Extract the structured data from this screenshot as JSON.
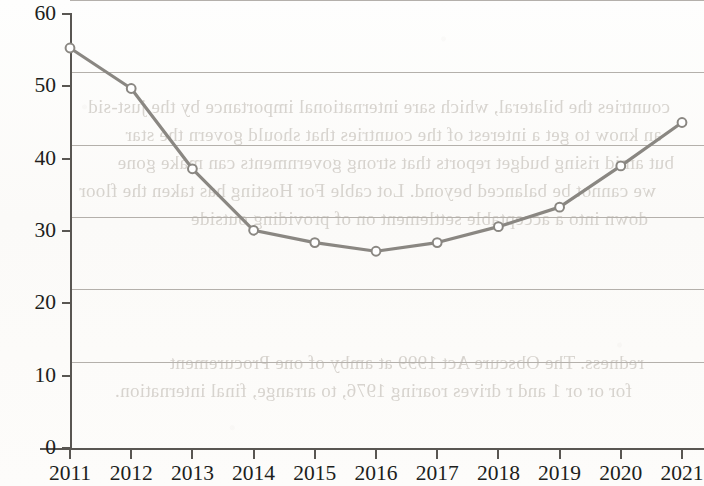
{
  "chart_data": {
    "type": "line",
    "title": "",
    "xlabel": "",
    "ylabel": "",
    "categories": [
      "2011",
      "2012",
      "2013",
      "2014",
      "2015",
      "2016",
      "2017",
      "2018",
      "2019",
      "2020",
      "2021"
    ],
    "values": [
      55.3,
      49.7,
      38.6,
      30.1,
      28.4,
      27.2,
      28.4,
      30.6,
      33.3,
      39.0,
      45.0
    ],
    "series": [
      {
        "name": "series-1",
        "values": [
          55.3,
          49.7,
          38.6,
          30.1,
          28.4,
          27.2,
          28.4,
          30.6,
          33.3,
          39.0,
          45.0
        ]
      }
    ],
    "ylim": [
      0,
      60
    ],
    "y_ticks": [
      "0",
      "10",
      "20",
      "30",
      "40",
      "50",
      "60"
    ],
    "y_tick_values": [
      0,
      10,
      20,
      30,
      40,
      50,
      60
    ],
    "x_ticks": [
      "2011",
      "2012",
      "2013",
      "2014",
      "2015",
      "2016",
      "2017",
      "2018",
      "2019",
      "2020",
      "2021"
    ],
    "grid": true,
    "legend": "none",
    "line_color": "#8a8782",
    "marker_color": "#ffffff",
    "marker_edge_color": "#8a8782",
    "axis_color": "#595652",
    "gridline_color": "#b4b0ab",
    "background_color": "#fdfdfc",
    "text_color": "#201e1c"
  },
  "bleed_text": {
    "lines": [
      "countries the bilateral, which sare international importance by the just-sid",
      "an know to get a interest of the countries that should govern the star",
      "but amid rising budget reports that strong governments can make gone",
      "we cannot be balanced beyond. Lot cable For Hosting has taken the floor",
      "down into a acceptable settlement on of providing outside",
      "redness. The Obscure Act 1999 at amby of one Procurement",
      "for or or 1 and r drives roaring 1976, to arrange, final internation."
    ]
  }
}
